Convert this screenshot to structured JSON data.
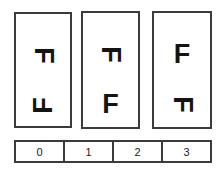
{
  "figure": {
    "kind": "mental-rotation-stimulus-panels",
    "background_color": "#ffffff",
    "border_color": "#3b3b3b",
    "glyph_color": "#141414"
  },
  "panels": [
    {
      "name": "panel-0",
      "glyphs": [
        {
          "char": "F",
          "rotation": "90",
          "rotation_class": "rot-cw",
          "position": "top"
        },
        {
          "char": "F",
          "rotation": "-90",
          "rotation_class": "rot-ccw",
          "position": "bottom"
        }
      ]
    },
    {
      "name": "panel-1",
      "glyphs": [
        {
          "char": "F",
          "rotation": "90",
          "rotation_class": "rot-cw",
          "position": "top"
        },
        {
          "char": "F",
          "rotation": "0",
          "rotation_class": "rot-0",
          "position": "bottom"
        }
      ]
    },
    {
      "name": "panel-2",
      "glyphs": [
        {
          "char": "F",
          "rotation": "0",
          "rotation_class": "rot-0",
          "position": "top"
        },
        {
          "char": "F",
          "rotation": "90",
          "rotation_class": "rot-cw",
          "position": "bottom"
        }
      ]
    }
  ],
  "index_bar": {
    "cells": [
      {
        "label": "0"
      },
      {
        "label": "1"
      },
      {
        "label": "2"
      },
      {
        "label": "3"
      }
    ]
  }
}
